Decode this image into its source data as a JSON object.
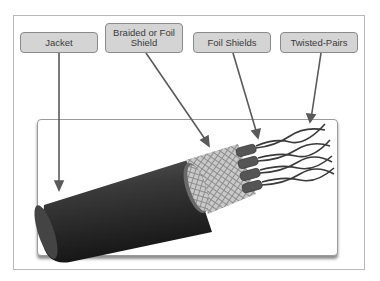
{
  "diagram": {
    "labels": [
      {
        "id": "jacket",
        "text": "Jacket"
      },
      {
        "id": "braided-shield",
        "text": "Braided or Foil Shield"
      },
      {
        "id": "foil-shields",
        "text": "Foil Shields"
      },
      {
        "id": "twisted-pairs",
        "text": "Twisted-Pairs"
      }
    ],
    "colors": {
      "label_fill": "#d4d4d4",
      "label_border": "#8a8a8a",
      "arrow": "#5a5a5a",
      "jacket": "#3c3c3c",
      "shield": "#b8b8b8"
    }
  }
}
